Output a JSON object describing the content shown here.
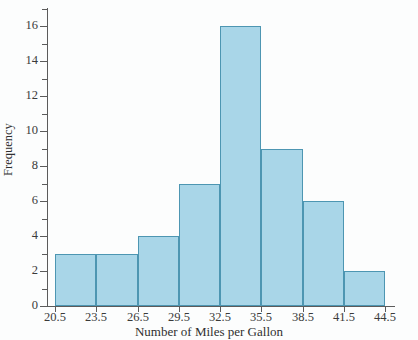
{
  "chart_data": {
    "type": "bar",
    "title": "",
    "subtitle": "",
    "xlabel": "Number of Miles per Gallon",
    "ylabel": "Frequency",
    "categories": [
      "20.5-23.5",
      "23.5-26.5",
      "26.5-29.5",
      "29.5-32.5",
      "32.5-35.5",
      "35.5-38.5",
      "38.5-41.5",
      "41.5-44.5"
    ],
    "bin_edges": [
      20.5,
      23.5,
      26.5,
      29.5,
      32.5,
      35.5,
      38.5,
      41.5,
      44.5
    ],
    "bin_width": 3,
    "values": [
      3,
      3,
      4,
      7,
      16,
      9,
      6,
      2
    ],
    "xlim": [
      20.5,
      44.5
    ],
    "ylim": [
      0,
      17
    ],
    "x_tick_labels": [
      "20.5",
      "23.5",
      "26.5",
      "29.5",
      "32.5",
      "35.5",
      "38.5",
      "41.5",
      "44.5"
    ],
    "x_tick_values": [
      20.5,
      23.5,
      26.5,
      29.5,
      32.5,
      35.5,
      38.5,
      41.5,
      44.5
    ],
    "y_tick_labels": [
      "0",
      "2",
      "4",
      "6",
      "8",
      "10",
      "12",
      "14",
      "16"
    ],
    "y_tick_values": [
      0,
      2,
      4,
      6,
      8,
      10,
      12,
      14,
      16
    ],
    "y_minor_tick_values": [
      1,
      3,
      5,
      7,
      9,
      11,
      13,
      15,
      17
    ],
    "grid": false,
    "legend": false,
    "legend_position": "none",
    "colors": {
      "bar_fill": "#a9d6e8",
      "bar_border": "#4d96b2",
      "axis": "#5b5b5b",
      "text": "#2f2f2f",
      "background": "#fcfdfd"
    }
  }
}
